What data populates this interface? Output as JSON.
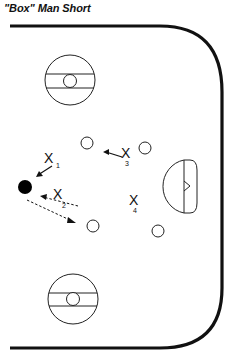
{
  "title": "\"Box\" Man Short",
  "colors": {
    "line": "#111111",
    "background": "#ffffff"
  },
  "rink": {
    "faceoff_circles": [
      {
        "name": "top-faceoff-circle",
        "cx": 70,
        "cy": 80,
        "r": 25
      },
      {
        "name": "bottom-faceoff-circle",
        "cx": 73,
        "cy": 299,
        "r": 25
      }
    ],
    "goal_crease": {
      "cx": 180,
      "cy": 187
    }
  },
  "puck": {
    "cx": 22,
    "cy": 187
  },
  "offensive_players": [
    {
      "id": "O1",
      "cx": 87,
      "cy": 143
    },
    {
      "id": "O2",
      "cx": 145,
      "cy": 148
    },
    {
      "id": "O3",
      "cx": 93,
      "cy": 226
    },
    {
      "id": "O4",
      "cx": 158,
      "cy": 231
    }
  ],
  "defenders": [
    {
      "label": "X",
      "sub": "1",
      "x": 50,
      "y": 158
    },
    {
      "label": "X",
      "sub": "2",
      "x": 58,
      "y": 193
    },
    {
      "label": "X",
      "sub": "3",
      "x": 127,
      "y": 152
    },
    {
      "label": "X",
      "sub": "4",
      "x": 133,
      "y": 210
    }
  ]
}
